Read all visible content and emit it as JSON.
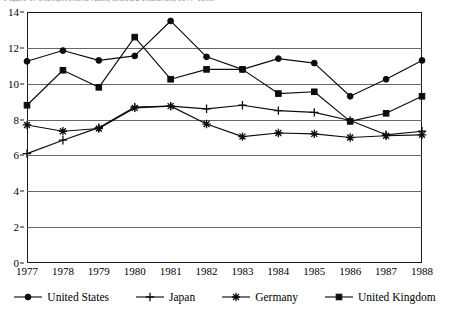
{
  "figure": {
    "title_sliver": "Figure 1. Unemployment rates, selected countries, 1977-1988",
    "background_color": "#ffffff",
    "ink_color": "#0d0d0d",
    "gridline_color": "#666666"
  },
  "chart_data": {
    "type": "line",
    "title": "",
    "subtitle": "",
    "xlabel": "",
    "ylabel": "",
    "categories": [
      "1977",
      "1978",
      "1979",
      "1980",
      "1981",
      "1982",
      "1983",
      "1984",
      "1985",
      "1986",
      "1987",
      "1988"
    ],
    "x": [
      1977,
      1978,
      1979,
      1980,
      1981,
      1982,
      1983,
      1984,
      1985,
      1986,
      1987,
      1988
    ],
    "ylim": [
      0,
      14
    ],
    "yticks": [
      0,
      2,
      4,
      6,
      8,
      10,
      12,
      14
    ],
    "ytick_labels": [
      "0",
      "2",
      "4",
      "6",
      "8",
      "10",
      "12",
      "14"
    ],
    "grid": true,
    "grid_axis": "y",
    "legend_position": "bottom",
    "series": [
      {
        "name": "United States",
        "marker": "circle",
        "values": [
          11.25,
          11.85,
          11.3,
          11.55,
          13.5,
          11.5,
          10.8,
          11.4,
          11.15,
          9.3,
          10.25,
          11.3
        ]
      },
      {
        "name": "Japan",
        "marker": "plus",
        "values": [
          6.1,
          6.85,
          7.55,
          8.7,
          8.75,
          8.6,
          8.8,
          8.5,
          8.4,
          7.95,
          7.15,
          7.35
        ]
      },
      {
        "name": "Germany",
        "marker": "star",
        "values": [
          7.7,
          7.35,
          7.5,
          8.65,
          8.75,
          7.75,
          7.05,
          7.25,
          7.2,
          7.0,
          7.1,
          7.15
        ]
      },
      {
        "name": "United Kingdom",
        "marker": "square",
        "values": [
          8.8,
          10.75,
          9.8,
          12.6,
          10.25,
          10.8,
          10.8,
          9.45,
          9.55,
          7.9,
          8.35,
          9.3
        ]
      }
    ]
  },
  "legend": {
    "entries": [
      {
        "label": "United States",
        "marker": "circle"
      },
      {
        "label": "Japan",
        "marker": "plus"
      },
      {
        "label": "Germany",
        "marker": "star"
      },
      {
        "label": "United Kingdom",
        "marker": "square"
      }
    ]
  }
}
